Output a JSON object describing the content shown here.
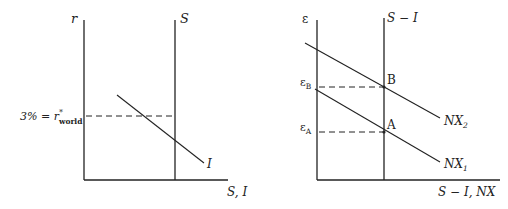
{
  "left_panel": {
    "y_axis_label": "r",
    "x_axis_label": "S, I",
    "saving_curve_label": "S",
    "investment_curve_label": "I",
    "world_rate_label_prefix": "3% = r",
    "world_rate_superscript": "*",
    "world_rate_subscript": "world"
  },
  "right_panel": {
    "y_axis_label": "ε",
    "x_axis_label": "S − I, NX",
    "vertical_curve_label": "S − I",
    "nx1_label": "NX",
    "nx1_subscript": "1",
    "nx2_label": "NX",
    "nx2_subscript": "2",
    "point_a_label": "A",
    "point_b_label": "B",
    "epsilon_a_label": "ε",
    "epsilon_a_subscript": "A",
    "epsilon_b_label": "ε",
    "epsilon_b_subscript": "B"
  },
  "colors": {
    "line": "#222222",
    "background": "#ffffff"
  }
}
